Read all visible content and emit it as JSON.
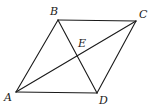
{
  "figure": {
    "type": "parallelogram-with-diagonals",
    "points": {
      "A": {
        "label": "A",
        "x": 16,
        "y": 92,
        "lx": 4,
        "ly": 101
      },
      "B": {
        "label": "B",
        "x": 58,
        "y": 20,
        "lx": 50,
        "ly": 15
      },
      "C": {
        "label": "C",
        "x": 136,
        "y": 21,
        "lx": 139,
        "ly": 18
      },
      "D": {
        "label": "D",
        "x": 97,
        "y": 93,
        "lx": 99,
        "ly": 104
      },
      "E": {
        "label": "E",
        "x": 77,
        "y": 57,
        "lx": 78,
        "ly": 47
      }
    },
    "sides": [
      "AB",
      "BC",
      "CD",
      "DA"
    ],
    "diagonals": [
      "AC",
      "BD"
    ],
    "stroke_color": "#1a1a1a",
    "background": "#ffffff"
  }
}
